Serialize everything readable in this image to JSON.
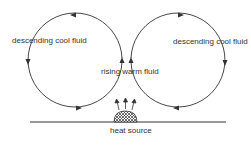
{
  "diagram": {
    "labels": {
      "left_loop": "descending cool fluid",
      "right_loop": "descending cool fluid",
      "center": "rising warm fluid",
      "source": "heat source"
    },
    "colors": {
      "line": "#333333",
      "background": "#ffffff"
    }
  }
}
